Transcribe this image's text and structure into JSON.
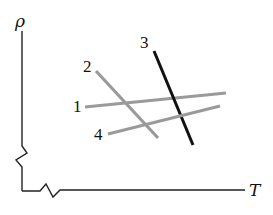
{
  "diagram": {
    "y_axis": {
      "label": "ρ"
    },
    "x_axis": {
      "label": "T"
    },
    "lines": [
      {
        "id": "1",
        "label": "1",
        "color": "#9a9a9a",
        "x1": 85,
        "y1": 107,
        "x2": 226,
        "y2": 93,
        "label_x": 73,
        "label_y": 112
      },
      {
        "id": "2",
        "label": "2",
        "color": "#9a9a9a",
        "x1": 96,
        "y1": 71,
        "x2": 158,
        "y2": 138,
        "label_x": 83,
        "label_y": 72
      },
      {
        "id": "3",
        "label": "3",
        "color": "#111111",
        "x1": 154,
        "y1": 51,
        "x2": 193,
        "y2": 145,
        "label_x": 140,
        "label_y": 48
      },
      {
        "id": "4",
        "label": "4",
        "color": "#9a9a9a",
        "x1": 108,
        "y1": 134,
        "x2": 220,
        "y2": 106,
        "label_x": 94,
        "label_y": 140
      }
    ]
  }
}
